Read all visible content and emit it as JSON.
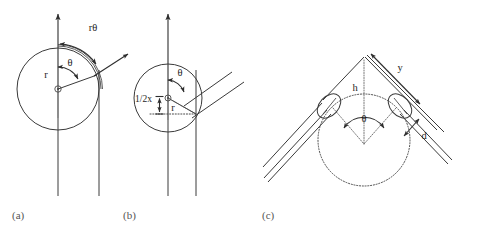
{
  "figure": {
    "title_visible": false,
    "background_color": "#ffffff",
    "stroke_color": "#3a3a3a",
    "label_color": "#1d1d1d",
    "panel_label_color": "#555555",
    "width": 482,
    "height": 231
  },
  "panels": [
    {
      "id": "a",
      "label": "(a)",
      "description": "Circle of radius r on a vertical axis with angle theta and arc length r-theta",
      "labels": {
        "radius": "r",
        "angle": "θ",
        "arc": "rθ"
      },
      "icons": [
        "up-arrow-icon",
        "diagonal-ray-arrow-icon",
        "arc-double-arrow-icon",
        "center-dot-icon"
      ]
    },
    {
      "id": "b",
      "label": "(b)",
      "description": "Circle on vertical axis with half-x offset measurement, radius r, angle theta and two parallel diagonal lines",
      "labels": {
        "half_x": "1/2x",
        "radius": "r",
        "angle": "θ"
      },
      "icons": [
        "up-arrow-icon",
        "vertical-measure-arrow-icon",
        "angle-arrow-icon",
        "center-dot-icon"
      ]
    },
    {
      "id": "c",
      "label": "(c)",
      "description": "Chevron of two bent double lines over a dotted circle, with height h, arm length y, opening angle theta and thickness d",
      "labels": {
        "arm": "y",
        "height": "h",
        "angle": "θ",
        "thickness": "d"
      },
      "icons": [
        "arm-double-arrow-icon",
        "angle-double-arrow-icon",
        "thickness-double-arrow-icon",
        "dotted-circle-icon",
        "bend-ellipse-icon"
      ]
    }
  ]
}
